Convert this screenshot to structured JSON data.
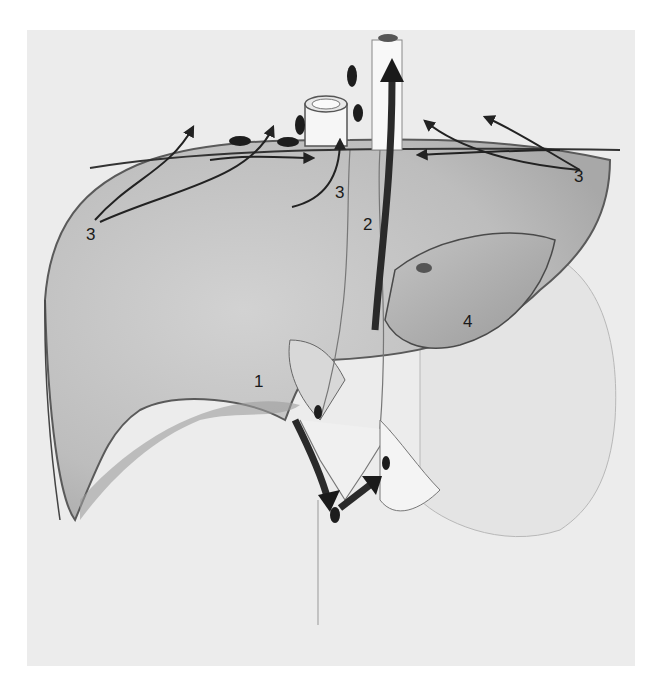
{
  "figure": {
    "background_panel_color": "#ececec",
    "page_color": "#ffffff",
    "ink_color": "#1a1a1a",
    "labels": [
      {
        "id": "label-3-left",
        "text": "3",
        "x": 86,
        "y": 226
      },
      {
        "id": "label-3-center",
        "text": "3",
        "x": 335,
        "y": 184
      },
      {
        "id": "label-2",
        "text": "2",
        "x": 363,
        "y": 216
      },
      {
        "id": "label-3-right",
        "text": "3",
        "x": 574,
        "y": 168
      },
      {
        "id": "label-4",
        "text": "4",
        "x": 463,
        "y": 313
      },
      {
        "id": "label-1",
        "text": "1",
        "x": 254,
        "y": 373
      }
    ]
  }
}
